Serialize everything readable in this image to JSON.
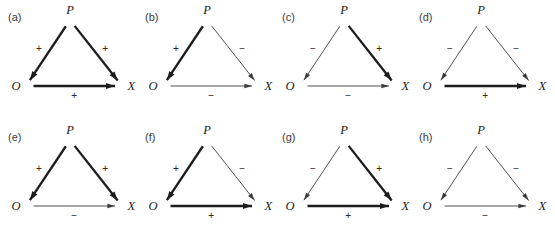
{
  "figure": {
    "background_color": "#ffffff",
    "ink_color": "#1c1c1c",
    "thin_ink_color": "#3c3c3c",
    "rows": 2,
    "columns": 4,
    "node_names": {
      "source": "P",
      "left": "O",
      "right": "X"
    },
    "sign_positive": "+",
    "sign_negative": "−",
    "edge_style_note": {
      "positive": "thick",
      "negative": "thin"
    }
  },
  "panels": [
    {
      "label": "(a)",
      "nodes": {
        "top": "P",
        "left": "O",
        "right": "X"
      },
      "edges": [
        {
          "name": "p-to-o",
          "from": "P",
          "to": "O",
          "sign": "+",
          "weight": "thick"
        },
        {
          "name": "p-to-x",
          "from": "P",
          "to": "X",
          "sign": "+",
          "weight": "thick"
        },
        {
          "name": "o-to-x",
          "from": "O",
          "to": "X",
          "sign": "+",
          "weight": "thick"
        }
      ]
    },
    {
      "label": "(b)",
      "nodes": {
        "top": "P",
        "left": "O",
        "right": "X"
      },
      "edges": [
        {
          "name": "p-to-o",
          "from": "P",
          "to": "O",
          "sign": "+",
          "weight": "thick"
        },
        {
          "name": "p-to-x",
          "from": "P",
          "to": "X",
          "sign": "−",
          "weight": "thin"
        },
        {
          "name": "o-to-x",
          "from": "O",
          "to": "X",
          "sign": "−",
          "weight": "thin"
        }
      ]
    },
    {
      "label": "(c)",
      "nodes": {
        "top": "P",
        "left": "O",
        "right": "X"
      },
      "edges": [
        {
          "name": "p-to-o",
          "from": "P",
          "to": "O",
          "sign": "−",
          "weight": "thin"
        },
        {
          "name": "p-to-x",
          "from": "P",
          "to": "X",
          "sign": "+",
          "weight": "thick"
        },
        {
          "name": "o-to-x",
          "from": "O",
          "to": "X",
          "sign": "−",
          "weight": "thin"
        }
      ]
    },
    {
      "label": "(d)",
      "nodes": {
        "top": "P",
        "left": "O",
        "right": "X"
      },
      "edges": [
        {
          "name": "p-to-o",
          "from": "P",
          "to": "O",
          "sign": "−",
          "weight": "thin"
        },
        {
          "name": "p-to-x",
          "from": "P",
          "to": "X",
          "sign": "−",
          "weight": "thin"
        },
        {
          "name": "o-to-x",
          "from": "O",
          "to": "X",
          "sign": "+",
          "weight": "thick"
        }
      ]
    },
    {
      "label": "(e)",
      "nodes": {
        "top": "P",
        "left": "O",
        "right": "X"
      },
      "edges": [
        {
          "name": "p-to-o",
          "from": "P",
          "to": "O",
          "sign": "+",
          "weight": "thick"
        },
        {
          "name": "p-to-x",
          "from": "P",
          "to": "X",
          "sign": "+",
          "weight": "thick"
        },
        {
          "name": "o-to-x",
          "from": "O",
          "to": "X",
          "sign": "−",
          "weight": "thin"
        }
      ]
    },
    {
      "label": "(f)",
      "nodes": {
        "top": "P",
        "left": "O",
        "right": "X"
      },
      "edges": [
        {
          "name": "p-to-o",
          "from": "P",
          "to": "O",
          "sign": "+",
          "weight": "thick"
        },
        {
          "name": "p-to-x",
          "from": "P",
          "to": "X",
          "sign": "−",
          "weight": "thin"
        },
        {
          "name": "o-to-x",
          "from": "O",
          "to": "X",
          "sign": "+",
          "weight": "thick"
        }
      ]
    },
    {
      "label": "(g)",
      "nodes": {
        "top": "P",
        "left": "O",
        "right": "X"
      },
      "edges": [
        {
          "name": "p-to-o",
          "from": "P",
          "to": "O",
          "sign": "−",
          "weight": "thin"
        },
        {
          "name": "p-to-x",
          "from": "P",
          "to": "X",
          "sign": "+",
          "weight": "thick"
        },
        {
          "name": "o-to-x",
          "from": "O",
          "to": "X",
          "sign": "+",
          "weight": "thick"
        }
      ]
    },
    {
      "label": "(h)",
      "nodes": {
        "top": "P",
        "left": "O",
        "right": "X"
      },
      "edges": [
        {
          "name": "p-to-o",
          "from": "P",
          "to": "O",
          "sign": "−",
          "weight": "thin"
        },
        {
          "name": "p-to-x",
          "from": "P",
          "to": "X",
          "sign": "−",
          "weight": "thin"
        },
        {
          "name": "o-to-x",
          "from": "O",
          "to": "X",
          "sign": "−",
          "weight": "thin"
        }
      ]
    }
  ]
}
